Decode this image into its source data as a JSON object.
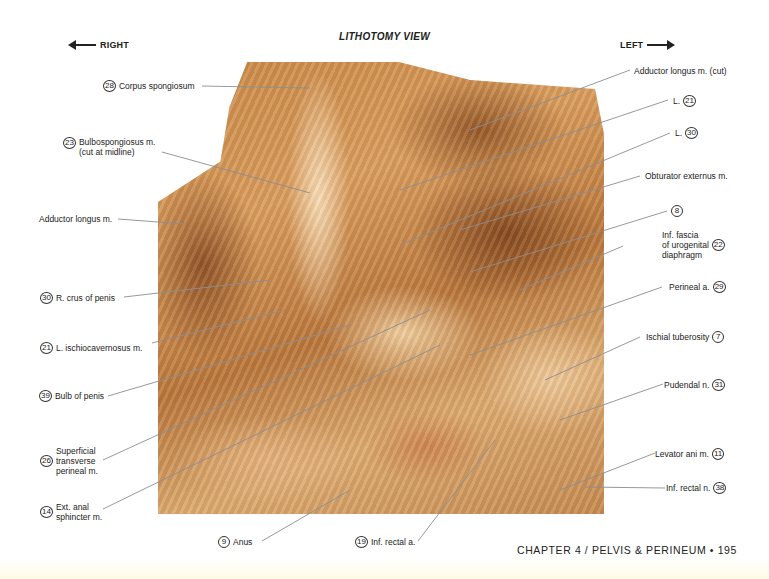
{
  "header": {
    "direction_right": "RIGHT",
    "direction_left": "LEFT",
    "view_title": "LITHOTOMY VIEW"
  },
  "figure": {
    "accent_colors": {
      "tissue_light": "#f2d6aa",
      "tissue_mid": "#c98848",
      "tissue_dark": "#7a4620",
      "leader_line": "#8a8f96"
    }
  },
  "labels_left": [
    {
      "num": "28",
      "text": "Corpus spongiosum",
      "text2": ""
    },
    {
      "num": "23",
      "text": "Bulbospongiosus m.",
      "text2": "(cut at midline)"
    },
    {
      "num": "",
      "text": "Adductor longus m.",
      "text2": ""
    },
    {
      "num": "30",
      "text": "R. crus of penis",
      "text2": ""
    },
    {
      "num": "21",
      "text": "L. ischiocavernosus m.",
      "text2": ""
    },
    {
      "num": "39",
      "text": "Bulb of penis",
      "text2": ""
    },
    {
      "num": "26",
      "text": "Superficial",
      "text2": "transverse",
      "text3": "perineal m."
    },
    {
      "num": "14",
      "text": "Ext. anal",
      "text2": "sphincter m."
    }
  ],
  "labels_right": [
    {
      "num": "",
      "text": "Adductor longus m. (cut)"
    },
    {
      "num": "21",
      "text": "L."
    },
    {
      "num": "30",
      "text": "L."
    },
    {
      "num": "",
      "text": "Obturator externus m."
    },
    {
      "num": "8",
      "text": ""
    },
    {
      "num": "22",
      "text": "Inf. fascia",
      "text2": "of urogenital",
      "text3": "diaphragm"
    },
    {
      "num": "29",
      "text": "Perineal a."
    },
    {
      "num": "7",
      "text": "Ischial tuberosity"
    },
    {
      "num": "31",
      "text": "Pudendal n."
    },
    {
      "num": "11",
      "text": "Levator ani m."
    },
    {
      "num": "38",
      "text": "Inf. rectal n."
    }
  ],
  "labels_bottom": [
    {
      "num": "9",
      "text": "Anus"
    },
    {
      "num": "19",
      "text": "Inf. rectal a."
    }
  ],
  "footer": {
    "running_head": "CHAPTER 4 / PELVIS & PERINEUM • 195"
  }
}
